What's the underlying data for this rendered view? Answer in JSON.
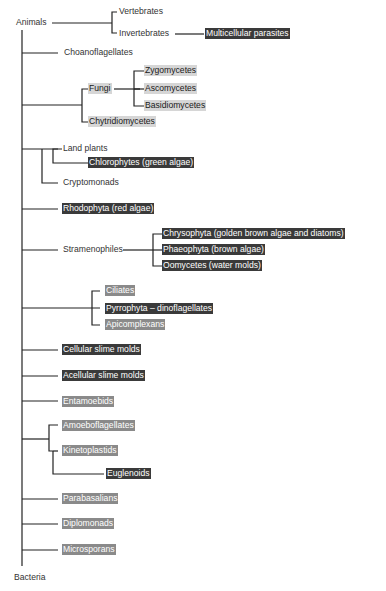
{
  "diagram": {
    "type": "phylogenetic-tree",
    "root_top": "Animals",
    "root_bottom": "Bacteria",
    "styles": {
      "plain": {
        "bg": "transparent",
        "fg": "#333333"
      },
      "light": {
        "bg": "#d6d6d6",
        "fg": "#1a1a1a"
      },
      "dark": {
        "bg": "#3a3a3a",
        "fg": "#ffffff"
      },
      "mid": {
        "bg": "#8a8a8a",
        "fg": "#ffffff"
      }
    },
    "labels": {
      "animals": "Animals",
      "vertebrates": "Vertebrates",
      "invertebrates": "Invertebrates",
      "multicellular_parasites": "Multicellular parasites",
      "choanoflagellates": "Choanoflagellates",
      "fungi": "Fungi",
      "zygomycetes": "Zygomycetes",
      "ascomycetes": "Ascomycetes",
      "basidiomycetes": "Basidiomycetes",
      "chytridiomycetes": "Chytridiomycetes",
      "land_plants": "Land plants",
      "chlorophytes": "Chlorophytes (green algae)",
      "cryptomonads": "Cryptomonads",
      "rhodophyta": "Rhodophyta (red algae)",
      "stramenophiles": "Stramenophiles",
      "chrysophyta": "Chrysophyta (golden brown algae and diatoms)",
      "phaeophyta": "Phaeophyta (brown algae)",
      "oomycetes": "Oomycetes (water molds)",
      "ciliates": "Ciliates",
      "pyrrophyta": "Pyrrophyta – dinoflagellates",
      "apicomplexans": "Apicomplexans",
      "cellular_slime_molds": "Cellular slime molds",
      "acellular_slime_molds": "Acellular slime molds",
      "entamoebids": "Entamoebids",
      "amoeboflagellates": "Amoeboflagellates",
      "kinetoplastids": "Kinetoplastids",
      "euglenoids": "Euglenoids",
      "parabasalians": "Parabasalians",
      "diplomonads": "Diplomonads",
      "microsporans": "Microsporans",
      "bacteria": "Bacteria"
    }
  }
}
